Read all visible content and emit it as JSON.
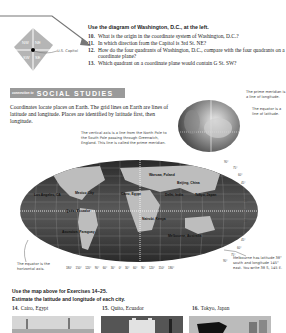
{
  "dc_diagram": {
    "quadrants": [
      "NW",
      "NE",
      "SW",
      "SE"
    ],
    "capitol_label": "U.S. Capitol"
  },
  "exercises_top": {
    "heading": "Use the diagram of Washington, D.C., at the left.",
    "items": [
      {
        "num": "10.",
        "text": "What is the origin in the coordinate system of Washington, D.C.?"
      },
      {
        "num": "11.",
        "text": "In which direction from the Capitol is 3rd St. NE?"
      },
      {
        "num": "12.",
        "text": "How do the four quadrants of Washington, D.C., compare with the four quadrants on a coordinate plane?"
      },
      {
        "num": "13.",
        "text": "Which quadrant on a coordinate plane would contain G St. SW?"
      }
    ]
  },
  "social_studies": {
    "banner_small": "connection to",
    "banner_big": "SOCIAL STUDIES",
    "intro": "Coordinates locate places on Earth. The grid lines on Earth are lines of latitude and longitude. Places are identified by latitude first, then longitude."
  },
  "callouts": {
    "vertical_axis": "The vertical axis is a line from the North Pole to the South Pole passing through Greenwich, England. This line is called the prime meridian.",
    "prime_meridian": "The prime meridian is a line of longitude.",
    "equator_latitude": "The equator is a line of latitude.",
    "equator_horizontal": "The equator is the horizontal axis.",
    "melbourne": "Melbourne has latitude 38° south and longitude 145° east. You write 38 S, 145 E."
  },
  "map": {
    "labels": [
      {
        "text": "Warsaw, Poland",
        "x": 155,
        "y": 176
      },
      {
        "text": "Beijing, China",
        "x": 184,
        "y": 183
      },
      {
        "text": "Cairo, Egypt",
        "x": 132,
        "y": 193
      },
      {
        "text": "Delhi, India",
        "x": 168,
        "y": 193
      },
      {
        "text": "Tokyo, Japan",
        "x": 198,
        "y": 193
      },
      {
        "text": "Mexico City",
        "x": 52,
        "y": 194
      },
      {
        "text": "Los Angeles, CA",
        "x": 36,
        "y": 190
      },
      {
        "text": "Quito, Ecuador",
        "x": 66,
        "y": 211
      },
      {
        "text": "Nairobi, Kenya",
        "x": 143,
        "y": 218
      },
      {
        "text": "Asuncion, Paraguay",
        "x": 64,
        "y": 232
      },
      {
        "text": "Melbourne, Australia",
        "x": 170,
        "y": 236
      }
    ],
    "longitude_ticks": [
      "180°",
      "150°",
      "120°",
      "90°",
      "60°",
      "30°",
      "0°",
      "30°",
      "60°",
      "90°",
      "120°",
      "150°",
      "180°"
    ],
    "latitude_ticks": [
      "90°",
      "75°",
      "60°",
      "45°",
      "30°",
      "15°",
      "0°",
      "15°",
      "30°",
      "45°",
      "60°",
      "75°",
      "90°"
    ]
  },
  "bottom": {
    "heading1": "Use the map above for Exercises 14–25.",
    "heading2": "Estimate the latitude and longitude of each city.",
    "cities": [
      {
        "num": "14.",
        "name": "Cairo, Egypt"
      },
      {
        "num": "15.",
        "name": "Quito, Ecuador"
      },
      {
        "num": "16.",
        "name": "Tokyo, Japan"
      }
    ]
  }
}
